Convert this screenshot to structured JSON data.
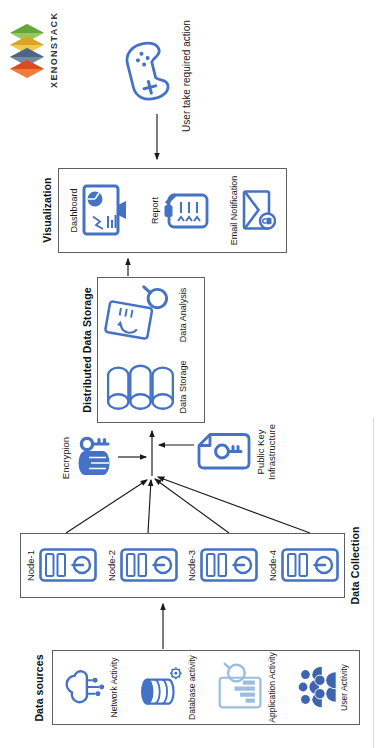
{
  "logo": {
    "brand": "XENONSTACK"
  },
  "user_action": {
    "label": "User take required action"
  },
  "visualization": {
    "title": "Visualization",
    "items": [
      {
        "label": "Dashboard"
      },
      {
        "label": "Report"
      },
      {
        "label": "Email Notification"
      }
    ]
  },
  "storage": {
    "title": "Distributed Data Storage",
    "items": [
      {
        "label": "Data Storage"
      },
      {
        "label": "Data Analysis"
      }
    ]
  },
  "encryption": {
    "label": "Encrypion"
  },
  "pki": {
    "line1": "Public Key",
    "line2": "Infrastructure"
  },
  "collection": {
    "title": "Data Collection",
    "nodes": [
      {
        "label": "Node-1"
      },
      {
        "label": "Node-2"
      },
      {
        "label": "Node-3"
      },
      {
        "label": "Node-4"
      }
    ]
  },
  "sources": {
    "title": "Data sources",
    "items": [
      {
        "label": "Network Activity"
      },
      {
        "label": "Database activity"
      },
      {
        "label": "Application Activity"
      },
      {
        "label": "User Activity"
      }
    ]
  },
  "colors": {
    "primary_blue": "#4472C4",
    "light_blue": "#9DBCE0",
    "solid_blue": "#3E64AE",
    "line_dark": "#1a1a1a",
    "logo_orange": "#DA4B1E",
    "logo_slate": "#4E6781",
    "logo_yellow": "#D9A327",
    "logo_green": "#66A53C"
  }
}
